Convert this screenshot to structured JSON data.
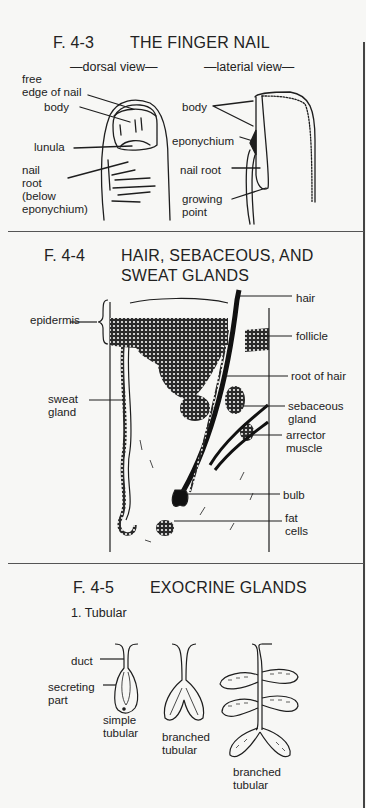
{
  "page": {
    "figures": [
      {
        "id": "F. 4-3",
        "title": "THE FINGER NAIL",
        "views": [
          "—dorsal view—",
          "—laterial view—"
        ],
        "labels_dorsal": [
          "free\nedge of nail",
          "body",
          "lunula",
          "nail\nroot\n(below\neponychium)"
        ],
        "labels_lateral": [
          "body",
          "eponychium",
          "nail root",
          "growing\npoint"
        ]
      },
      {
        "id": "F. 4-4",
        "title_line1": "HAIR, SEBACEOUS, AND",
        "title_line2": "SWEAT GLANDS",
        "labels_left": [
          "epidermis",
          "sweat\ngland"
        ],
        "labels_right": [
          "hair",
          "follicle",
          "root of hair",
          "sebaceous\ngland",
          "arrector\nmuscle",
          "bulb",
          "fat\ncells"
        ]
      },
      {
        "id": "F. 4-5",
        "title": "EXOCRINE GLANDS",
        "section": "1. Tubular",
        "labels": [
          "duct",
          "secreting\npart"
        ],
        "captions": [
          "simple\ntubular",
          "branched\ntubular",
          "branched\ntubular"
        ]
      }
    ]
  },
  "colors": {
    "background": "#f7f7f5",
    "ink": "#1e1e1e",
    "rule": "#555555"
  }
}
